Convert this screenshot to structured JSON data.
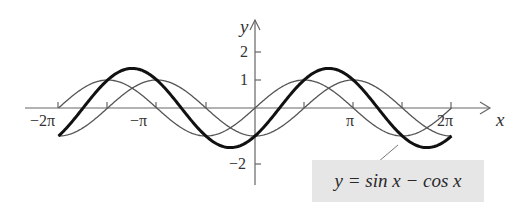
{
  "chart_data": {
    "type": "line",
    "title": "",
    "xlabel": "x",
    "ylabel": "y",
    "xlim": [
      -6.2832,
      6.2832
    ],
    "ylim": [
      -2.5,
      2.6
    ],
    "grid": false,
    "x_ticks": [
      {
        "value": -6.2832,
        "label": "−2π"
      },
      {
        "value": -4.7124,
        "label": ""
      },
      {
        "value": -3.1416,
        "label": "−π"
      },
      {
        "value": -1.5708,
        "label": ""
      },
      {
        "value": 1.5708,
        "label": ""
      },
      {
        "value": 3.1416,
        "label": "π"
      },
      {
        "value": 4.7124,
        "label": ""
      },
      {
        "value": 6.2832,
        "label": "2π"
      }
    ],
    "y_ticks": [
      {
        "value": 2,
        "label": "2"
      },
      {
        "value": 1,
        "label": "1"
      },
      {
        "value": -2,
        "label": "−2"
      }
    ],
    "series": [
      {
        "name": "y = sin x",
        "function": "sin(x)",
        "style": "thin",
        "domain": [
          -6.2832,
          6.2832
        ]
      },
      {
        "name": "y = -cos x",
        "function": "-cos(x)",
        "style": "thin",
        "domain": [
          -6.2832,
          6.2832
        ]
      },
      {
        "name": "y = sin x − cos x",
        "function": "sin(x) - cos(x)",
        "style": "thick",
        "domain": [
          -6.2832,
          6.2832
        ],
        "key_points": [
          {
            "x": -6.2832,
            "y": -1
          },
          {
            "x": -3.927,
            "y": 1.414
          },
          {
            "x": -0.7854,
            "y": -1.414
          },
          {
            "x": 0,
            "y": -1
          },
          {
            "x": 2.3562,
            "y": 1.414
          },
          {
            "x": 5.4978,
            "y": -1.414
          },
          {
            "x": 6.2832,
            "y": -1
          }
        ]
      }
    ],
    "annotations": [
      {
        "text": "y = sin x − cos x",
        "points_to": "thick curve near x ≈ 5.2"
      }
    ]
  },
  "labels": {
    "x_axis": "x",
    "y_axis": "y",
    "xtick_neg2pi": "−2π",
    "xtick_negpi": "−π",
    "xtick_pi": "π",
    "xtick_2pi": "2π",
    "ytick_2": "2",
    "ytick_1": "1",
    "ytick_neg2": "−2",
    "legend": "y = sin x − cos x"
  },
  "colors": {
    "thin_curve": "#555555",
    "thick_curve": "#111111",
    "axis": "#666666",
    "legend_bg": "#e6e6e6"
  }
}
